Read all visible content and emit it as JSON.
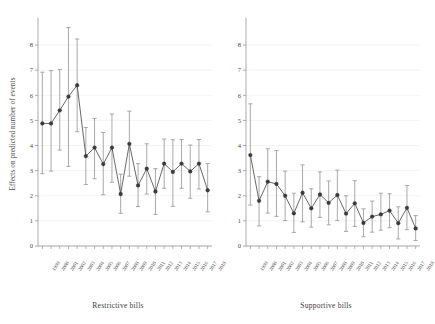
{
  "figure": {
    "ylabel": "Effects on predicted number of events",
    "background": "#ffffff",
    "marker_color": "#3a3a3a",
    "line_color": "#4d4d4d",
    "errorbar_color": "#9a9a9a",
    "grid_color": "#ebebeb",
    "axis_color": "#a0a0a0"
  },
  "chart_data": {
    "type": "line",
    "title": "",
    "xlabel": "",
    "ylabel": "Effects on predicted number of events",
    "ylim": [
      0,
      8.6
    ],
    "yticks": [
      0,
      1,
      2,
      3,
      4,
      5,
      6,
      7,
      8
    ],
    "grid": true,
    "legend": "none",
    "categories": [
      "1999",
      "2000",
      "2001",
      "2002",
      "2003",
      "2004",
      "2005",
      "2006",
      "2007",
      "2008",
      "2009",
      "2010",
      "2011",
      "2012",
      "2013",
      "2014",
      "2015",
      "2016",
      "2017",
      "2018"
    ],
    "panels": [
      {
        "name": "Restrictive bills",
        "xlabel": "Restrictive bills",
        "values": [
          4.88,
          4.88,
          5.4,
          5.95,
          6.4,
          3.58,
          3.92,
          3.26,
          3.92,
          2.07,
          4.07,
          2.41,
          3.08,
          2.17,
          3.28,
          2.95,
          3.28,
          2.97,
          3.28,
          2.22
        ],
        "ci_low": [
          2.88,
          2.98,
          3.82,
          3.17,
          4.55,
          2.45,
          2.68,
          2.04,
          2.54,
          1.3,
          2.78,
          1.57,
          2.07,
          1.26,
          2.3,
          1.58,
          2.3,
          1.9,
          2.27,
          1.36
        ],
        "ci_high": [
          6.92,
          6.98,
          7.03,
          8.7,
          8.24,
          4.72,
          5.08,
          4.52,
          5.25,
          2.86,
          5.37,
          3.28,
          4.07,
          3.08,
          4.26,
          4.23,
          4.24,
          4.02,
          4.24,
          3.28
        ]
      },
      {
        "name": "Supportive bills",
        "xlabel": "Supportive bills",
        "values": [
          3.62,
          1.8,
          2.56,
          2.47,
          2.0,
          1.3,
          2.12,
          1.5,
          2.05,
          1.72,
          2.03,
          1.29,
          1.7,
          0.92,
          1.17,
          1.26,
          1.41,
          0.91,
          1.52,
          0.7
        ],
        "ci_low": [
          1.63,
          0.8,
          1.31,
          1.18,
          1.01,
          0.54,
          0.96,
          0.75,
          1.14,
          0.84,
          1.01,
          0.58,
          0.78,
          0.37,
          0.55,
          0.63,
          0.73,
          0.28,
          0.65,
          0.22
        ],
        "ci_high": [
          5.66,
          2.76,
          3.87,
          3.8,
          2.98,
          2.1,
          3.23,
          2.28,
          2.95,
          2.59,
          3.02,
          2.0,
          2.6,
          1.48,
          1.79,
          2.1,
          2.08,
          1.56,
          2.41,
          1.21
        ]
      }
    ]
  },
  "axes": {
    "left": {
      "panel_title": "Restrictive bills",
      "yticks": [
        "0",
        "1",
        "2",
        "3",
        "4",
        "5",
        "6",
        "7",
        "8"
      ],
      "xticks": [
        "1999",
        "2000",
        "2001",
        "2002",
        "2003",
        "2004",
        "2005",
        "2006",
        "2007",
        "2008",
        "2009",
        "2010",
        "2011",
        "2012",
        "2013",
        "2014",
        "2015",
        "2016",
        "2017",
        "2018"
      ]
    },
    "right": {
      "panel_title": "Supportive bills",
      "yticks": [
        "0",
        "1",
        "2",
        "3",
        "4",
        "5",
        "6",
        "7",
        "8"
      ],
      "xticks": [
        "1999",
        "2000",
        "2001",
        "2002",
        "2003",
        "2004",
        "2005",
        "2006",
        "2007",
        "2008",
        "2009",
        "2010",
        "2011",
        "2012",
        "2013",
        "2014",
        "2015",
        "2016",
        "2017",
        "2018"
      ]
    }
  }
}
